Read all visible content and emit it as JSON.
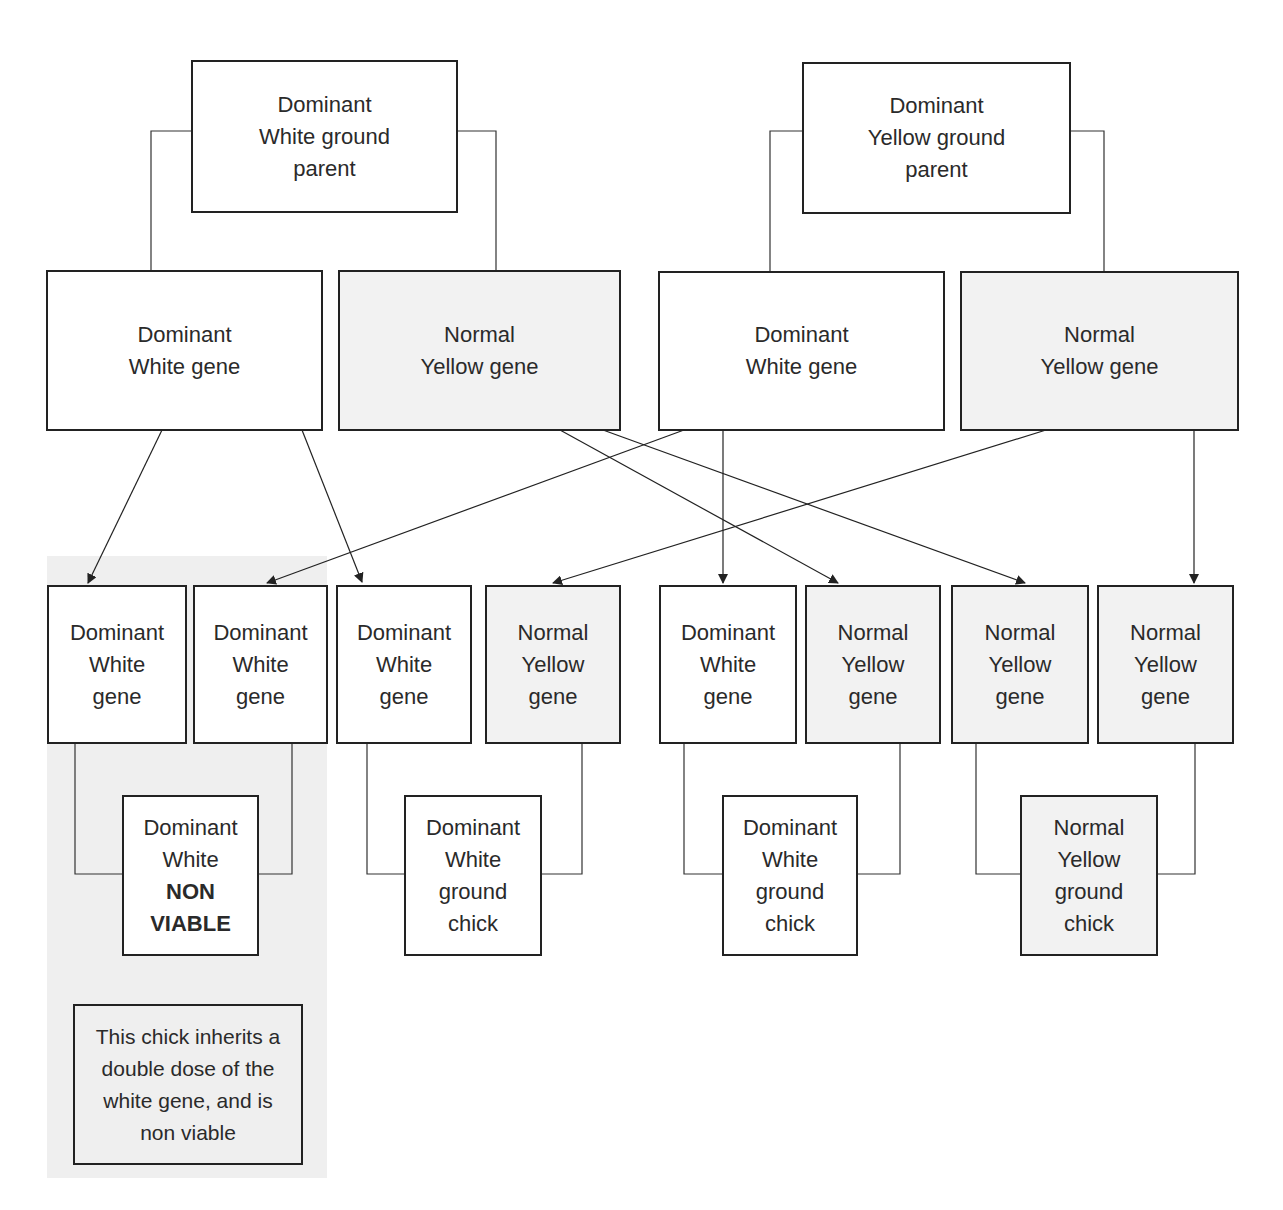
{
  "colors": {
    "line": "#222222",
    "white_box_fill": "#ffffff",
    "yellow_box_fill": "#f2f2f2",
    "highlight_panel": "#efefef"
  },
  "parents": {
    "left": "Dominant\nWhite ground\nparent",
    "right": "Dominant\nYellow ground\nparent"
  },
  "parent_genes": {
    "left_white": "Dominant\nWhite gene",
    "left_yellow": "Normal\nYellow gene",
    "right_white": "Dominant\nWhite gene",
    "right_yellow": "Normal\nYellow gene"
  },
  "offspring_genes": [
    {
      "label": "Dominant\nWhite\ngene",
      "type": "white"
    },
    {
      "label": "Dominant\nWhite\ngene",
      "type": "white"
    },
    {
      "label": "Dominant\nWhite\ngene",
      "type": "white"
    },
    {
      "label": "Normal\nYellow\ngene",
      "type": "yellow"
    },
    {
      "label": "Dominant\nWhite\ngene",
      "type": "white"
    },
    {
      "label": "Normal\nYellow\ngene",
      "type": "yellow"
    },
    {
      "label": "Normal\nYellow\ngene",
      "type": "yellow"
    },
    {
      "label": "Normal\nYellow\ngene",
      "type": "yellow"
    }
  ],
  "chicks": {
    "non_viable": {
      "line1": "Dominant\nWhite",
      "bold": "NON\nVIABLE"
    },
    "white_ground_1": "Dominant\nWhite\nground\nchick",
    "white_ground_2": "Dominant\nWhite\nground\nchick",
    "yellow_ground": "Normal\nYellow\nground\nchick"
  },
  "note": "This chick inherits a\ndouble dose of the\nwhite gene, and is\nnon viable"
}
